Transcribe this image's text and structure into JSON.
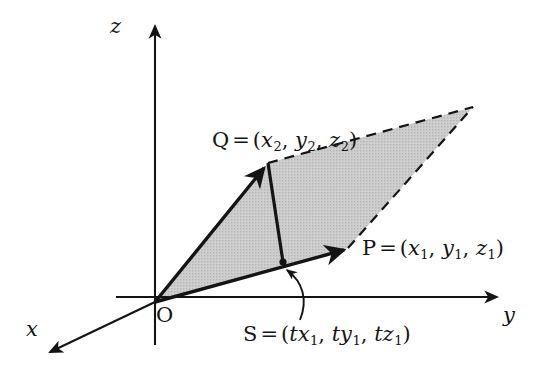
{
  "figure": {
    "kind": "vector-geometry-diagram",
    "background_color": "#ffffff",
    "line_color": "#141414",
    "fill_color": "#c8c8c8"
  },
  "axes": {
    "x": {
      "label": "x",
      "arrow": "down-left"
    },
    "y": {
      "label": "y",
      "arrow": "right"
    },
    "z": {
      "label": "z",
      "arrow": "up"
    }
  },
  "points": {
    "origin": {
      "name": "O",
      "label": "O"
    },
    "p": {
      "name": "P",
      "eq": "=",
      "open": "(",
      "close": ")",
      "c1": "x",
      "c1sub": "1",
      "c2": "y",
      "c2sub": "1",
      "c3": "z",
      "c3sub": "1",
      "sep": ","
    },
    "q": {
      "name": "Q",
      "eq": "=",
      "open": "(",
      "close": ")",
      "c1": "x",
      "c1sub": "2",
      "c2": "y",
      "c2sub": "2",
      "c3": "z",
      "c3sub": "2",
      "sep": ","
    },
    "s": {
      "name": "S",
      "eq": "=",
      "open": "(",
      "close": ")",
      "t": "t",
      "c1": "x",
      "c1sub": "1",
      "c2": "y",
      "c2sub": "1",
      "c3": "z",
      "c3sub": "1",
      "sep": ","
    }
  },
  "annotations": {
    "pointer_to_s": "curved-arrow"
  }
}
